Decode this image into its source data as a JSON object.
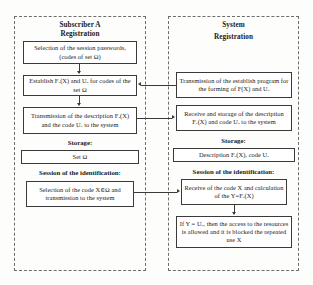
{
  "diagram": {
    "type": "flowchart",
    "panels": [
      {
        "id": "subscriber",
        "title_line1": "Subscriber A",
        "title_line2": "Registration",
        "storage_label": "Storage:",
        "session_label": "Session of the identification:",
        "boxes": [
          {
            "id": "select-passwords",
            "text": "Selection of the session passwords, (codes of set Ω)"
          },
          {
            "id": "establish-fa",
            "text": "Establish Fₐ(X) and Uₐ for codes of the set Ω"
          },
          {
            "id": "transmit-desc",
            "text": "Transmission of the description Fₐ(X) and the code Uₐ to the system"
          },
          {
            "id": "storage-set",
            "text": "Set Ω"
          },
          {
            "id": "select-code",
            "text": "Selection of the code X∈Ω and transmission to the system"
          }
        ]
      },
      {
        "id": "system",
        "title_line1": "System",
        "title_line2": "Registration",
        "storage_label": "Storage:",
        "session_label": "Session of the identification:",
        "boxes": [
          {
            "id": "transmit-program",
            "text": "Transmission of the establish program for the forming of F(X) and Uₐ"
          },
          {
            "id": "receive-storage",
            "text": "Receive and storage of the description Fₐ(X) and code Uₐ to the system"
          },
          {
            "id": "storage-desc",
            "text": "Description Fₐ(X), code Uₐ"
          },
          {
            "id": "receive-code",
            "text": "Receive of the code X and calculation of the Y=Fₐ(X)"
          },
          {
            "id": "access-decision",
            "text": "If Y = Uₐ, then the access to the resources is allowed and it is blocked the repeated use X"
          }
        ]
      }
    ],
    "connectors": [
      {
        "id": "program-to-establish",
        "direction": "left",
        "from": "transmit-program",
        "to": "establish-fa"
      },
      {
        "id": "desc-to-receive",
        "direction": "right",
        "from": "transmit-desc",
        "to": "receive-storage"
      },
      {
        "id": "code-to-receive",
        "direction": "right",
        "from": "select-code",
        "to": "receive-code"
      }
    ],
    "colors": {
      "box_border": "#3a3a3a",
      "panel_border": "#6d6d6d",
      "background": "#fdfdfc",
      "text": "#1a1a1a"
    }
  }
}
